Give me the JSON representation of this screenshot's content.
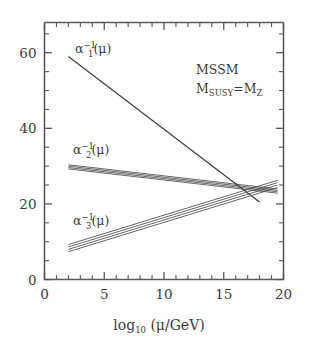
{
  "figure": {
    "background_color": "#ffffff",
    "ink_color": "#3c3c3e",
    "axis_color": "#555a5d"
  },
  "annotations": {
    "model_label": "MSSM",
    "susy_scale_prefix": "M",
    "susy_scale_sub": "SUSY",
    "susy_scale_eq": "=M",
    "susy_scale_sub2": "Z"
  },
  "labels": {
    "alpha1": {
      "base": "α",
      "sub": "1",
      "sup": "−1",
      "arg": "(μ)"
    },
    "alpha2": {
      "base": "α",
      "sub": "2",
      "sup": "−1",
      "arg": "(μ)"
    },
    "alpha3": {
      "base": "α",
      "sub": "3",
      "sup": "−1",
      "arg": "(μ)"
    }
  },
  "axis": {
    "x_title_main": "log",
    "x_title_sub": "10",
    "x_title_arg": "(μ/GeV)",
    "x_ticks": [
      "0",
      "5",
      "10",
      "15",
      "20"
    ],
    "y_ticks": [
      "0",
      "20",
      "40",
      "60"
    ]
  },
  "chart_data": {
    "type": "line",
    "title": "",
    "subtitle": "",
    "xlabel": "log_10 (mu/GeV)",
    "ylabel": "",
    "xlim": [
      0,
      20
    ],
    "ylim": [
      0,
      68
    ],
    "x_major_ticks": [
      0,
      5,
      10,
      15,
      20
    ],
    "y_major_ticks": [
      0,
      20,
      40,
      60
    ],
    "x_minor_tick_step": 1,
    "y_minor_tick_step": 5,
    "grid": false,
    "legend": "inline-curve-labels",
    "annotations": [
      {
        "text": "MSSM",
        "x": 12.2,
        "y": 53.5
      },
      {
        "text": "M_SUSY = M_Z",
        "x": 12.2,
        "y": 47.5
      }
    ],
    "series": [
      {
        "name": "alpha_1^-1(mu)",
        "style": "single-line",
        "band_width": 0.0,
        "x": [
          2.0,
          18.0
        ],
        "values": [
          59.0,
          20.5
        ],
        "label_pos": {
          "x": 4.6,
          "y": 62.0
        }
      },
      {
        "name": "alpha_2^-1(mu)",
        "style": "band",
        "band_width": 0.55,
        "band_lines": 4,
        "x": [
          2.0,
          19.5
        ],
        "values": [
          29.8,
          23.4
        ],
        "label_pos": {
          "x": 4.3,
          "y": 34.5
        }
      },
      {
        "name": "alpha_3^-1(mu)",
        "style": "band",
        "band_width": 0.95,
        "band_lines": 4,
        "x": [
          2.0,
          19.5
        ],
        "values": [
          8.3,
          25.3
        ],
        "label_pos": {
          "x": 4.3,
          "y": 17.8
        }
      }
    ],
    "unification": {
      "x": 16.2,
      "y": 24.4
    }
  }
}
